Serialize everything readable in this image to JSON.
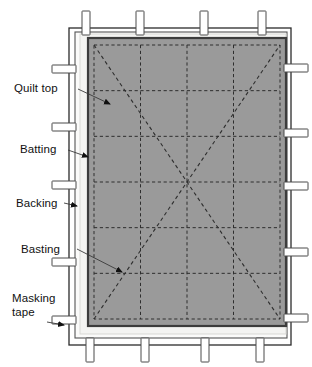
{
  "figure": {
    "type": "technical-illustration"
  },
  "colors": {
    "background": "#ffffff",
    "quilt_top_fill": "#9a9a9a",
    "quilt_top_border": "#3c3c3c",
    "batting_fill": "#f4f4f2",
    "backing_line": "#555555",
    "frame_line": "#2b2b2b",
    "tape_fill": "#ffffff",
    "tape_border": "#4a4a4a",
    "basting_line": "#2e2e2e",
    "label_text": "#111111",
    "leader_line": "#3a3a3a"
  },
  "labels": [
    {
      "id": "quilt-top",
      "text": "Quilt top",
      "x": 14,
      "y": 82,
      "align": "left"
    },
    {
      "id": "batting",
      "text": "Batting",
      "x": 20,
      "y": 143,
      "align": "left"
    },
    {
      "id": "backing",
      "text": "Backing",
      "x": 16,
      "y": 197,
      "align": "left"
    },
    {
      "id": "basting",
      "text": "Basting",
      "x": 21,
      "y": 243,
      "align": "left"
    },
    {
      "id": "masking-tape",
      "text": "Masking\ntape",
      "x": 12,
      "y": 292,
      "align": "left"
    }
  ],
  "leaders": [
    {
      "id": "leader-quilt-top",
      "from": [
        78,
        89
      ],
      "to": [
        110,
        104
      ],
      "arrow": true
    },
    {
      "id": "leader-batting",
      "from": [
        68,
        150
      ],
      "to": [
        88,
        157
      ],
      "arrow": true
    },
    {
      "id": "leader-backing",
      "from": [
        64,
        203
      ],
      "to": [
        77,
        206
      ],
      "arrow": true
    },
    {
      "id": "leader-basting",
      "from": [
        77,
        249
      ],
      "to": [
        122,
        272
      ],
      "arrow": true
    },
    {
      "id": "leader-masking-tape",
      "from": [
        47,
        322
      ],
      "to": [
        64,
        325
      ],
      "arrow": true
    }
  ],
  "frame": {
    "name": "work-surface-frame",
    "x": 69,
    "y": 28,
    "width": 222,
    "height": 317
  },
  "backing": {
    "name": "backing-layer",
    "x": 75,
    "y": 32,
    "width": 212,
    "height": 306
  },
  "batting": {
    "name": "batting-layer",
    "x": 80,
    "y": 34,
    "width": 206,
    "height": 300
  },
  "quilt_top": {
    "name": "quilt-top-layer",
    "x": 88,
    "y": 38,
    "width": 198,
    "height": 288
  },
  "basting_grid": {
    "name": "basting-grid",
    "x": 94,
    "y": 45,
    "width": 186,
    "height": 274,
    "columns": 4,
    "rows": 6,
    "diagonals": 2
  },
  "masking_tape": {
    "name": "masking-tape-strips",
    "top": [
      {
        "x": 86
      },
      {
        "x": 140
      },
      {
        "x": 204
      },
      {
        "x": 262
      }
    ],
    "bottom": [
      {
        "x": 90
      },
      {
        "x": 145
      },
      {
        "x": 205
      },
      {
        "x": 260
      }
    ],
    "left": [
      {
        "y": 69
      },
      {
        "y": 127
      },
      {
        "y": 185
      },
      {
        "y": 262
      },
      {
        "y": 320
      }
    ],
    "right": [
      {
        "y": 68
      },
      {
        "y": 133
      },
      {
        "y": 186
      },
      {
        "y": 252
      },
      {
        "y": 318
      }
    ],
    "strip_length": 24,
    "strip_width": 8
  }
}
